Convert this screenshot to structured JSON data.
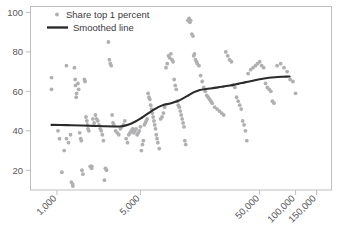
{
  "chart_data": {
    "type": "scatter",
    "title": "",
    "xlabel": "",
    "ylabel": "",
    "xscale": "log",
    "yscale": "linear",
    "grid": false,
    "legend_position": "top-left",
    "xlim": [
      600,
      200000
    ],
    "ylim": [
      10,
      103
    ],
    "xticks": [
      1000,
      5000,
      50000,
      100000,
      150000
    ],
    "xtick_labels": [
      "1,000",
      "5,000",
      "50,000",
      "100,000",
      "150,000"
    ],
    "yticks": [
      20,
      40,
      60,
      80,
      100
    ],
    "ytick_labels": [
      "20",
      "40",
      "60",
      "80",
      "100"
    ],
    "series": [
      {
        "name": "Share top 1 percent",
        "type": "scatter",
        "marker": "circle",
        "color": "#b0b0b2",
        "points": [
          [
            900,
            67
          ],
          [
            900,
            61
          ],
          [
            1020,
            40
          ],
          [
            1050,
            36
          ],
          [
            1100,
            19
          ],
          [
            1150,
            30
          ],
          [
            1200,
            73
          ],
          [
            1200,
            36
          ],
          [
            1250,
            34
          ],
          [
            1300,
            38
          ],
          [
            1320,
            14
          ],
          [
            1350,
            13
          ],
          [
            1360,
            12
          ],
          [
            1400,
            72
          ],
          [
            1420,
            66
          ],
          [
            1430,
            63
          ],
          [
            1450,
            57
          ],
          [
            1460,
            59
          ],
          [
            1500,
            64
          ],
          [
            1520,
            61
          ],
          [
            1550,
            39
          ],
          [
            1580,
            36
          ],
          [
            1600,
            35
          ],
          [
            1620,
            20
          ],
          [
            1650,
            18
          ],
          [
            1700,
            66
          ],
          [
            1720,
            65
          ],
          [
            1750,
            47
          ],
          [
            1780,
            45
          ],
          [
            1800,
            43
          ],
          [
            1820,
            41
          ],
          [
            1850,
            40
          ],
          [
            1900,
            22
          ],
          [
            1950,
            21
          ],
          [
            1960,
            22
          ],
          [
            2000,
            46
          ],
          [
            2050,
            44
          ],
          [
            2100,
            48
          ],
          [
            2150,
            46
          ],
          [
            2200,
            45
          ],
          [
            2250,
            43
          ],
          [
            2300,
            41
          ],
          [
            2350,
            40
          ],
          [
            2400,
            38
          ],
          [
            2450,
            35
          ],
          [
            2500,
            15
          ],
          [
            2550,
            21
          ],
          [
            2600,
            20
          ],
          [
            2700,
            85
          ],
          [
            2750,
            76
          ],
          [
            2800,
            74
          ],
          [
            2850,
            73
          ],
          [
            2900,
            48
          ],
          [
            2950,
            44
          ],
          [
            3000,
            43
          ],
          [
            3100,
            40
          ],
          [
            3200,
            39
          ],
          [
            3300,
            38
          ],
          [
            3400,
            41
          ],
          [
            3500,
            42
          ],
          [
            3600,
            43
          ],
          [
            3700,
            45
          ],
          [
            3800,
            36
          ],
          [
            3900,
            34
          ],
          [
            4000,
            38
          ],
          [
            4100,
            39
          ],
          [
            4200,
            40
          ],
          [
            4300,
            41
          ],
          [
            4400,
            39
          ],
          [
            4500,
            40
          ],
          [
            4600,
            41
          ],
          [
            4700,
            38
          ],
          [
            4800,
            39
          ],
          [
            4900,
            40
          ],
          [
            5000,
            42
          ],
          [
            5100,
            30
          ],
          [
            5200,
            33
          ],
          [
            5300,
            35
          ],
          [
            5400,
            43
          ],
          [
            5500,
            44
          ],
          [
            5600,
            45
          ],
          [
            5700,
            46
          ],
          [
            5800,
            59
          ],
          [
            5900,
            57
          ],
          [
            6000,
            56
          ],
          [
            6100,
            53
          ],
          [
            6200,
            51
          ],
          [
            6300,
            49
          ],
          [
            6400,
            47
          ],
          [
            6500,
            45
          ],
          [
            6600,
            43
          ],
          [
            6700,
            41
          ],
          [
            6800,
            38
          ],
          [
            6900,
            36
          ],
          [
            7000,
            34
          ],
          [
            7200,
            31
          ],
          [
            7400,
            46
          ],
          [
            7600,
            47
          ],
          [
            7800,
            49
          ],
          [
            8000,
            52
          ],
          [
            8200,
            72
          ],
          [
            8400,
            74
          ],
          [
            8600,
            78
          ],
          [
            8800,
            77
          ],
          [
            9000,
            79
          ],
          [
            9200,
            76
          ],
          [
            9400,
            75
          ],
          [
            9600,
            66
          ],
          [
            9800,
            63
          ],
          [
            10000,
            61
          ],
          [
            10200,
            55
          ],
          [
            10400,
            53
          ],
          [
            10600,
            52
          ],
          [
            10800,
            50
          ],
          [
            11000,
            48
          ],
          [
            11200,
            46
          ],
          [
            11400,
            44
          ],
          [
            11600,
            42
          ],
          [
            11800,
            35
          ],
          [
            12000,
            33
          ],
          [
            12500,
            96
          ],
          [
            12800,
            97
          ],
          [
            13000,
            95
          ],
          [
            13200,
            96
          ],
          [
            13500,
            89
          ],
          [
            13800,
            88
          ],
          [
            14000,
            78
          ],
          [
            14200,
            79
          ],
          [
            14500,
            76
          ],
          [
            14800,
            75
          ],
          [
            15000,
            74
          ],
          [
            15500,
            73
          ],
          [
            16000,
            68
          ],
          [
            16500,
            65
          ],
          [
            17000,
            62
          ],
          [
            17500,
            60
          ],
          [
            18000,
            58
          ],
          [
            18500,
            57
          ],
          [
            19000,
            56
          ],
          [
            19500,
            55
          ],
          [
            20000,
            54
          ],
          [
            21000,
            52
          ],
          [
            22000,
            51
          ],
          [
            23000,
            50
          ],
          [
            24000,
            49
          ],
          [
            25000,
            48
          ],
          [
            26000,
            80
          ],
          [
            27000,
            78
          ],
          [
            28000,
            76
          ],
          [
            29000,
            75
          ],
          [
            30000,
            63
          ],
          [
            31000,
            62
          ],
          [
            32000,
            57
          ],
          [
            33000,
            55
          ],
          [
            34000,
            53
          ],
          [
            35000,
            51
          ],
          [
            36000,
            45
          ],
          [
            37000,
            43
          ],
          [
            38000,
            40
          ],
          [
            39000,
            35
          ],
          [
            40000,
            69
          ],
          [
            42000,
            71
          ],
          [
            44000,
            72
          ],
          [
            46000,
            73
          ],
          [
            48000,
            74
          ],
          [
            50000,
            75
          ],
          [
            52000,
            73
          ],
          [
            54000,
            72
          ],
          [
            56000,
            64
          ],
          [
            58000,
            62
          ],
          [
            60000,
            61
          ],
          [
            62000,
            60
          ],
          [
            64000,
            55
          ],
          [
            66000,
            54
          ],
          [
            70000,
            73
          ],
          [
            75000,
            74
          ],
          [
            80000,
            72
          ],
          [
            85000,
            70
          ],
          [
            90000,
            66
          ],
          [
            95000,
            65
          ],
          [
            100000,
            59
          ]
        ]
      },
      {
        "name": "Smoothed line",
        "type": "line",
        "color": "#2b2b2b",
        "points": [
          [
            900,
            43.0
          ],
          [
            1200,
            42.9
          ],
          [
            1600,
            42.7
          ],
          [
            2000,
            42.5
          ],
          [
            2500,
            42.3
          ],
          [
            3000,
            42.2
          ],
          [
            3500,
            42.3
          ],
          [
            4000,
            43.2
          ],
          [
            4500,
            44.6
          ],
          [
            5000,
            46.2
          ],
          [
            5600,
            48.2
          ],
          [
            6300,
            50.2
          ],
          [
            7000,
            51.9
          ],
          [
            7900,
            53.2
          ],
          [
            8900,
            53.8
          ],
          [
            10000,
            54.8
          ],
          [
            11200,
            56.2
          ],
          [
            12600,
            57.9
          ],
          [
            14100,
            59.6
          ],
          [
            15800,
            60.7
          ],
          [
            17800,
            61.2
          ],
          [
            20000,
            61.6
          ],
          [
            22400,
            62.0
          ],
          [
            25100,
            62.5
          ],
          [
            28200,
            63.0
          ],
          [
            31600,
            63.6
          ],
          [
            35500,
            64.2
          ],
          [
            39800,
            64.9
          ],
          [
            44700,
            65.5
          ],
          [
            50100,
            66.1
          ],
          [
            56200,
            66.6
          ],
          [
            63100,
            67.0
          ],
          [
            70800,
            67.3
          ],
          [
            79400,
            67.4
          ],
          [
            89100,
            67.5
          ]
        ]
      }
    ]
  },
  "legend": {
    "entries": [
      {
        "label": "Share top 1 percent",
        "marker": "dot"
      },
      {
        "label": "Smoothed line",
        "marker": "line"
      }
    ]
  }
}
